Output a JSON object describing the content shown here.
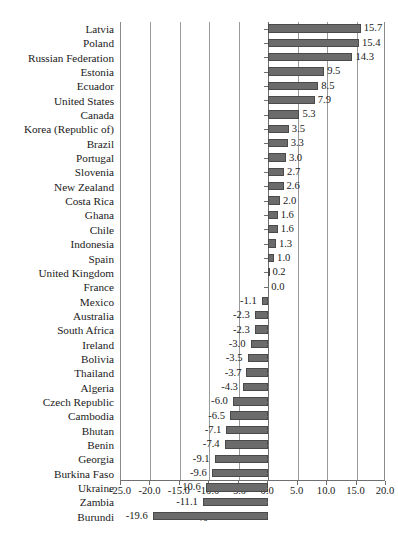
{
  "chart_data": {
    "type": "bar",
    "orientation": "horizontal",
    "title": "",
    "xlabel": "%",
    "ylabel": "",
    "xlim": [
      -25.0,
      20.0
    ],
    "xticks": [
      "-25.0",
      "-20.0",
      "-15.0",
      "-10.0",
      "-5.0",
      "0.0",
      "5.0",
      "10.0",
      "15.0",
      "20.0"
    ],
    "xtick_values": [
      -25,
      -20,
      -15,
      -10,
      -5,
      0,
      5,
      10,
      15,
      20
    ],
    "grid": true,
    "grid_axis": "x",
    "legend": null,
    "bar_color": "#6b6b6b",
    "categories": [
      "Latvia",
      "Poland",
      "Russian Federation",
      "Estonia",
      "Ecuador",
      "United States",
      "Canada",
      "Korea (Republic of)",
      "Brazil",
      "Portugal",
      "Slovenia",
      "New Zealand",
      "Costa Rica",
      "Ghana",
      "Chile",
      "Indonesia",
      "Spain",
      "United Kingdom",
      "France",
      "Mexico",
      "Australia",
      "South Africa",
      "Ireland",
      "Bolivia",
      "Thailand",
      "Algeria",
      "Czech Republic",
      "Cambodia",
      "Bhutan",
      "Benin",
      "Georgia",
      "Burkina Faso",
      "Ukraine",
      "Zambia",
      "Burundi"
    ],
    "values": [
      15.7,
      15.4,
      14.3,
      9.5,
      8.5,
      7.9,
      5.3,
      3.5,
      3.3,
      3.0,
      2.7,
      2.6,
      2.0,
      1.6,
      1.6,
      1.3,
      1.0,
      0.2,
      0.0,
      -1.1,
      -2.3,
      -2.3,
      -3.0,
      -3.5,
      -3.7,
      -4.3,
      -6.0,
      -6.5,
      -7.1,
      -7.4,
      -9.1,
      -9.6,
      -10.6,
      -11.1,
      -19.6
    ],
    "labels": [
      "15.7",
      "15.4",
      "14.3",
      "9.5",
      "8.5",
      "7.9",
      "5.3",
      "3.5",
      "3.3",
      "3.0",
      "2.7",
      "2.6",
      "2.0",
      "1.6",
      "1.6",
      "1.3",
      "1.0",
      "0.2",
      "0.0",
      "-1.1",
      "-2.3",
      "-2.3",
      "-3.0",
      "-3.5",
      "-3.7",
      "-4.3",
      "-6.0",
      "-6.5",
      "-7.1",
      "-7.4",
      "-9.1",
      "-9.6",
      "-10.6",
      "-11.1",
      "-19.6"
    ]
  }
}
